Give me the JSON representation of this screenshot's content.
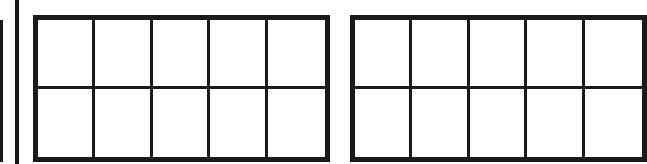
{
  "diagram": {
    "type": "ten-frames",
    "colors": {
      "stroke": "#1a1a1a",
      "background": "#ffffff"
    },
    "frames": [
      {
        "id": "left-partial-frame",
        "visible": "partial-right-edge",
        "rows": 2,
        "columns": 5,
        "filled_cells": 0
      },
      {
        "id": "center-frame",
        "visible": "full",
        "rows": 2,
        "columns": 5,
        "filled_cells": 0
      },
      {
        "id": "right-partial-frame",
        "visible": "partial-left-edge",
        "rows": 2,
        "columns": 5,
        "visible_columns": 3,
        "filled_cells": 0
      }
    ]
  }
}
